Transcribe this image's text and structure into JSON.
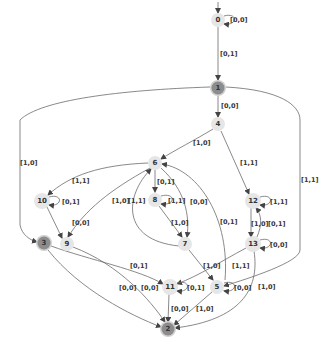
{
  "diagram": {
    "type": "state-machine",
    "colors": {
      "normal_node": "#e6e6e6",
      "accepting_node": "#8c8c8c",
      "edge": "#6b6b6b",
      "label": "#333333"
    },
    "nodes": [
      {
        "id": "0",
        "label": "0",
        "x": 218,
        "y": 20,
        "accepting": false,
        "initial": true
      },
      {
        "id": "1",
        "label": "1",
        "x": 218,
        "y": 88,
        "accepting": true
      },
      {
        "id": "4",
        "label": "4",
        "x": 218,
        "y": 124,
        "accepting": false
      },
      {
        "id": "6",
        "label": "6",
        "x": 155,
        "y": 163,
        "accepting": false
      },
      {
        "id": "8",
        "label": "8",
        "x": 155,
        "y": 200,
        "accepting": false
      },
      {
        "id": "10",
        "label": "10",
        "x": 42,
        "y": 201,
        "accepting": false
      },
      {
        "id": "12",
        "label": "12",
        "x": 253,
        "y": 201,
        "accepting": false
      },
      {
        "id": "7",
        "label": "7",
        "x": 185,
        "y": 244,
        "accepting": false
      },
      {
        "id": "9",
        "label": "9",
        "x": 67,
        "y": 244,
        "accepting": false
      },
      {
        "id": "3",
        "label": "3",
        "x": 44,
        "y": 243,
        "accepting": true
      },
      {
        "id": "13",
        "label": "13",
        "x": 253,
        "y": 244,
        "accepting": false
      },
      {
        "id": "11",
        "label": "11",
        "x": 170,
        "y": 287,
        "accepting": false
      },
      {
        "id": "5",
        "label": "5",
        "x": 217,
        "y": 287,
        "accepting": false
      },
      {
        "id": "2",
        "label": "2",
        "x": 168,
        "y": 329,
        "accepting": true
      }
    ],
    "edges": [
      {
        "from": "0",
        "to": "0",
        "label": "[0,0]"
      },
      {
        "from": "0",
        "to": "1",
        "label": "[0,1]"
      },
      {
        "from": "1",
        "to": "4",
        "label": "[0,0]"
      },
      {
        "from": "1",
        "to": "3",
        "label": "[1,0]"
      },
      {
        "from": "1",
        "to": "5",
        "label": "[1,1]"
      },
      {
        "from": "4",
        "to": "6",
        "label": "[1,0]"
      },
      {
        "from": "4",
        "to": "12",
        "label": "[1,1]"
      },
      {
        "from": "6",
        "to": "10",
        "label": "[1,1]"
      },
      {
        "from": "6",
        "to": "8",
        "label": "[0,1]"
      },
      {
        "from": "6",
        "to": "9",
        "label": "[1,0]"
      },
      {
        "from": "6",
        "to": "7",
        "label": "[0,0]"
      },
      {
        "from": "7",
        "to": "6",
        "label": "[1,1]"
      },
      {
        "from": "5",
        "to": "6",
        "label": "[0,1]"
      },
      {
        "from": "8",
        "to": "8",
        "label": "[1,1]"
      },
      {
        "from": "8",
        "to": "7",
        "label": "[1,0]"
      },
      {
        "from": "10",
        "to": "10",
        "label": "[0,1]"
      },
      {
        "from": "10",
        "to": "9",
        "label": "[0,0]"
      },
      {
        "from": "12",
        "to": "12",
        "label": "[1,1]"
      },
      {
        "from": "12",
        "to": "13",
        "label": "[1,0]"
      },
      {
        "from": "13",
        "to": "12",
        "label": "[0,1]"
      },
      {
        "from": "13",
        "to": "13",
        "label": "[0,0]"
      },
      {
        "from": "13",
        "to": "11",
        "label": "[1,1]"
      },
      {
        "from": "13",
        "to": "2",
        "label": "[1,0]"
      },
      {
        "from": "7",
        "to": "5",
        "label": "[1,0]"
      },
      {
        "from": "3",
        "to": "11",
        "label": "[0,1]"
      },
      {
        "from": "3",
        "to": "2",
        "label": "[0,0]"
      },
      {
        "from": "9",
        "to": "2",
        "label": "[0,0]"
      },
      {
        "from": "11",
        "to": "11",
        "label": "[0,1]"
      },
      {
        "from": "11",
        "to": "2",
        "label": "[0,0]"
      },
      {
        "from": "5",
        "to": "5",
        "label": "[0,0]"
      },
      {
        "from": "5",
        "to": "2",
        "label": "[1,0]"
      }
    ]
  }
}
